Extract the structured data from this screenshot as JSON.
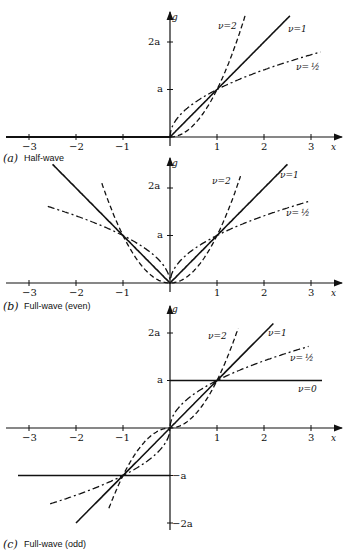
{
  "chart_data": [
    {
      "type": "line",
      "title": "(a) Half-wave",
      "panel_letter": "(a)",
      "caption": "Half-wave",
      "xlabel": "x",
      "ylabel": "g",
      "xticks": [
        "-3",
        "-2",
        "-1",
        "1",
        "2",
        "3"
      ],
      "yticks": [
        "a",
        "2a"
      ],
      "xlim": [
        -3.3,
        3.4
      ],
      "ylim": [
        0,
        2.8
      ],
      "series": [
        {
          "name": "ν=2",
          "label": "ν=2",
          "style": "dashed",
          "formula": "g = a·x^2 for x>0, 0 otherwise"
        },
        {
          "name": "ν=1",
          "label": "ν=1",
          "style": "solid",
          "formula": "g = a·x for x>0, 0 otherwise"
        },
        {
          "name": "ν=1/2",
          "label": "ν=½",
          "style": "dash-dot",
          "formula": "g = a·x^0.5 for x>0, 0 otherwise"
        }
      ]
    },
    {
      "type": "line",
      "title": "(b) Full-wave (even)",
      "panel_letter": "(b)",
      "caption": "Full-wave (even)",
      "xlabel": "x",
      "ylabel": "g",
      "xticks": [
        "-3",
        "-2",
        "-1",
        "1",
        "2",
        "3"
      ],
      "yticks": [
        "a",
        "2a"
      ],
      "xlim": [
        -3.3,
        3.4
      ],
      "ylim": [
        0,
        2.8
      ],
      "series": [
        {
          "name": "ν=2",
          "label": "ν=2",
          "style": "dashed",
          "formula": "g = a·|x|^2"
        },
        {
          "name": "ν=1",
          "label": "ν=1",
          "style": "solid",
          "formula": "g = a·|x|"
        },
        {
          "name": "ν=1/2",
          "label": "ν=½",
          "style": "dash-dot",
          "formula": "g = a·|x|^0.5"
        }
      ]
    },
    {
      "type": "line",
      "title": "(c) Full-wave (odd)",
      "panel_letter": "(c)",
      "caption": "Full-wave (odd)",
      "xlabel": "x",
      "ylabel": "g",
      "xticks": [
        "-3",
        "-2",
        "-1",
        "1",
        "2",
        "3"
      ],
      "yticks": [
        "2a",
        "a",
        "-a",
        "-2a"
      ],
      "xlim": [
        -3.3,
        3.4
      ],
      "ylim": [
        -2.2,
        2.8
      ],
      "series": [
        {
          "name": "ν=2",
          "label": "ν=2",
          "style": "dashed",
          "formula": "g = a·sgn(x)·|x|^2"
        },
        {
          "name": "ν=1",
          "label": "ν=1",
          "style": "solid",
          "formula": "g = a·x"
        },
        {
          "name": "ν=1/2",
          "label": "ν=½",
          "style": "dash-dot",
          "formula": "g = a·sgn(x)·|x|^0.5"
        },
        {
          "name": "ν=0",
          "label": "ν=0",
          "style": "solid",
          "formula": "g = a·sgn(x)"
        }
      ]
    }
  ],
  "labels": {
    "x": "x",
    "g": "g",
    "a": "a",
    "two_a": "2a",
    "neg_a": "−a",
    "neg_two_a": "−2a",
    "nu2": "ν=2",
    "nu1": "ν=1",
    "nuhalf": "ν=",
    "half": "½",
    "nu0": "ν=0",
    "t_m3": "−3",
    "t_m2": "−2",
    "t_m1": "−1",
    "t_1": "1",
    "t_2": "2",
    "t_3": "3",
    "cap_a_letter": "(a)",
    "cap_a": "Half-wave",
    "cap_b_letter": "(b)",
    "cap_b": "Full-wave (even)",
    "cap_c_letter": "(c)",
    "cap_c": "Full-wave (odd)"
  }
}
